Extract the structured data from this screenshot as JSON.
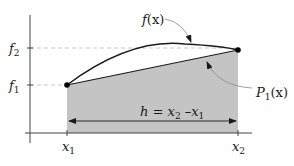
{
  "diagram": {
    "colors": {
      "shaded_area": "#c4c4c4",
      "axis": "#444444",
      "curve": "#1a1a1a",
      "guide": "#bbbbbb"
    },
    "labels": {
      "curve": {
        "base": "f",
        "arg": "(x)"
      },
      "line": {
        "base": "P",
        "sub": "1",
        "arg": "(x)"
      },
      "f1": {
        "base": "f",
        "sub": "1"
      },
      "f2": {
        "base": "f",
        "sub": "2"
      },
      "x1": {
        "base": "x",
        "sub": "1"
      },
      "x2": {
        "base": "x",
        "sub": "2"
      },
      "width": {
        "lhs": "h = x",
        "sub_a": "2",
        "mid": " –x",
        "sub_b": "1"
      }
    }
  }
}
